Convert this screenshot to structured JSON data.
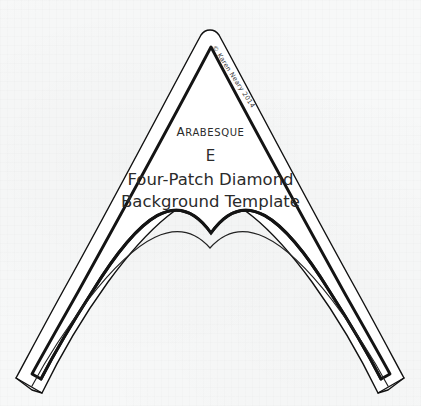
{
  "document": {
    "background_color": "#f7f8f8",
    "ink_color": "#111111",
    "text_color": "#2b2b2b"
  },
  "template": {
    "brand_line": "Arabesque",
    "letter_code": "E",
    "title_line": "Four-Patch Diamond",
    "subtitle_line": "Background Template",
    "copyright": "© Karen Neary 2014"
  },
  "shape": {
    "outer_outline_stroke_width": 1.4,
    "inner_outline_stroke_width": 2.9,
    "lower_arc_stroke_width": 1.2,
    "outer_apex": [
      210,
      30
    ],
    "inner_apex": [
      212,
      47
    ],
    "left_foot": [
      15,
      390
    ],
    "right_foot": [
      405,
      390
    ],
    "upper_arc_peak_y": 232,
    "lower_arc_peak_y": 247
  }
}
